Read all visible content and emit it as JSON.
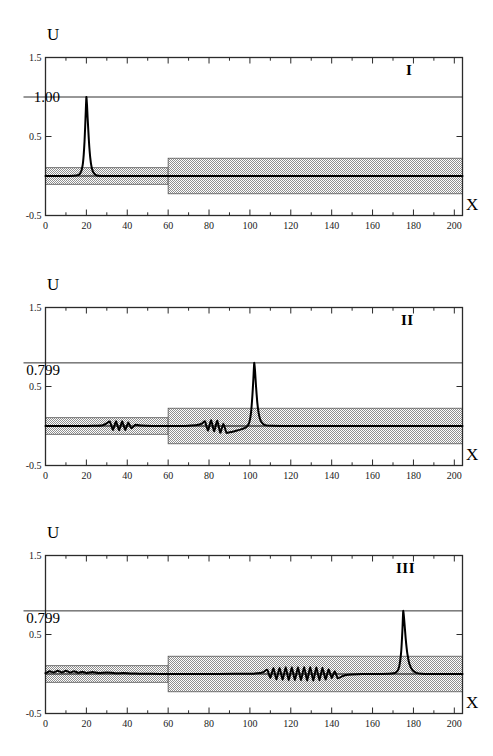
{
  "figure": {
    "width": 493,
    "height": 756,
    "background": "#ffffff",
    "ink": "#000000",
    "band_fill": "#b4b4b4",
    "band_edge": "#4d4d4d"
  },
  "axes": {
    "x_title": "X",
    "y_title": "U",
    "xlim": [
      0,
      204
    ],
    "ylim": [
      -0.5,
      1.5
    ],
    "x_major_ticks": [
      0,
      20,
      40,
      60,
      80,
      100,
      120,
      140,
      160,
      180,
      200
    ],
    "x_tick_labels": [
      "0",
      "20",
      "40",
      "60",
      "80",
      "100",
      "120",
      "140",
      "160",
      "180",
      "200"
    ],
    "y_major_ticks": [
      -0.5,
      0.5,
      1.5
    ],
    "y_tick_labels": [
      "-0.5",
      "0.5",
      "1.5"
    ],
    "grid": false,
    "minor_tick_step": 10
  },
  "panels": [
    {
      "id": "I",
      "label": "I",
      "peak_label": "1.00",
      "peak_value": 1.0,
      "peak_x": 20.0
    },
    {
      "id": "II",
      "label": "II",
      "peak_label": "0.799",
      "peak_value": 0.799,
      "peak_x": 102.0
    },
    {
      "id": "III",
      "label": "III",
      "peak_label": "0.799",
      "peak_value": 0.799,
      "peak_x": 175.0
    }
  ],
  "chart_data": {
    "type": "line",
    "title": "",
    "subtitle": "",
    "xlabel": "X",
    "ylabel": "U",
    "xlim": [
      0,
      204
    ],
    "ylim": [
      -0.5,
      1.5
    ],
    "grid": false,
    "legend_position": "none",
    "n_subplots": 3,
    "subplot_labels": [
      "I",
      "II",
      "III"
    ],
    "annotations": [
      {
        "subplot": "I",
        "text": "1.00",
        "y": 1.0,
        "type": "reference-line-label"
      },
      {
        "subplot": "I",
        "text": "I",
        "x": 175,
        "y": 1.28,
        "type": "panel-label"
      },
      {
        "subplot": "II",
        "text": "0.799",
        "y": 0.799,
        "type": "reference-line-label"
      },
      {
        "subplot": "II",
        "text": "II",
        "x": 175,
        "y": 1.28,
        "type": "panel-label"
      },
      {
        "subplot": "III",
        "text": "0.799",
        "y": 0.799,
        "type": "reference-line-label"
      },
      {
        "subplot": "III",
        "text": "III",
        "x": 175,
        "y": 1.28,
        "type": "panel-label"
      }
    ],
    "shaded_band": {
      "description": "stippled gray potential/waveguide band, steps wider at x=60",
      "segments": [
        {
          "x_start": 0,
          "x_end": 60,
          "y_lower": -0.105,
          "y_upper": 0.105
        },
        {
          "x_start": 60,
          "x_end": 204,
          "y_lower": -0.225,
          "y_upper": 0.225
        }
      ]
    },
    "reference_lines": [
      {
        "subplot": "I",
        "y": 1.0
      },
      {
        "subplot": "II",
        "y": 0.799
      },
      {
        "subplot": "III",
        "y": 0.799
      }
    ],
    "series": [
      {
        "name": "I",
        "subplot": "I",
        "peak_x": 20.0,
        "peak_y": 1.0,
        "baseline": 0.0,
        "x": [
          0,
          4,
          8,
          12,
          15,
          16.5,
          17.5,
          18.2,
          18.7,
          19.1,
          19.4,
          19.7,
          20,
          20.3,
          20.6,
          21,
          21.4,
          21.9,
          22.5,
          23.3,
          24.5,
          26,
          29,
          33,
          40,
          50,
          60,
          70,
          85,
          100,
          120,
          140,
          160,
          180,
          204
        ],
        "y": [
          0,
          0,
          0,
          0,
          0.005,
          0.02,
          0.06,
          0.14,
          0.27,
          0.44,
          0.62,
          0.82,
          1.0,
          0.9,
          0.74,
          0.55,
          0.38,
          0.23,
          0.12,
          0.05,
          0.015,
          0.004,
          0,
          0,
          0,
          0,
          0,
          0,
          0,
          0,
          0,
          0,
          0,
          0,
          0
        ]
      },
      {
        "name": "II",
        "subplot": "II",
        "peak_x": 102.0,
        "peak_y": 0.799,
        "baseline": 0.0,
        "x": [
          0,
          6,
          12,
          18,
          24,
          28,
          30,
          31.5,
          33,
          34.5,
          36,
          37.5,
          39,
          40.5,
          42,
          44,
          47,
          52,
          58,
          62,
          66,
          70,
          74,
          76.5,
          78,
          79.5,
          81,
          82.5,
          84,
          85.5,
          87,
          88.5,
          90,
          92,
          94,
          96,
          98,
          99.5,
          100.5,
          101.2,
          101.7,
          102.1,
          102.5,
          103,
          103.6,
          104.3,
          105.2,
          106.5,
          108,
          111,
          115,
          120,
          130,
          145,
          165,
          185,
          204
        ],
        "y": [
          0,
          0,
          0,
          0,
          0.002,
          0.01,
          0.035,
          0.055,
          -0.05,
          0.06,
          -0.055,
          0.06,
          -0.05,
          0.045,
          -0.03,
          0.015,
          0.005,
          0,
          0,
          0,
          0,
          0.004,
          0.012,
          0.03,
          0.06,
          -0.06,
          0.075,
          -0.07,
          0.07,
          -0.085,
          0.03,
          -0.085,
          -0.08,
          -0.07,
          -0.055,
          -0.04,
          -0.02,
          0.03,
          0.16,
          0.38,
          0.6,
          0.799,
          0.7,
          0.5,
          0.3,
          0.16,
          0.07,
          0.025,
          0.008,
          0.002,
          0,
          0,
          0,
          0,
          0,
          0,
          0
        ]
      },
      {
        "name": "III",
        "subplot": "III",
        "peak_x": 175.0,
        "peak_y": 0.799,
        "baseline": 0.0,
        "x": [
          0,
          2,
          4,
          6,
          8,
          10,
          12,
          14,
          16,
          18,
          20,
          23,
          26,
          30,
          34,
          38,
          42,
          46,
          52,
          60,
          70,
          85,
          100,
          105,
          107,
          108.5,
          110,
          111.5,
          113,
          114.5,
          116,
          117.5,
          119,
          120.5,
          122,
          123.5,
          125,
          126.5,
          128,
          129.5,
          131,
          132.5,
          134,
          135.5,
          137,
          138.5,
          140,
          141.5,
          143,
          145,
          147,
          150,
          155,
          162,
          168,
          171.5,
          173,
          174,
          174.6,
          175,
          175.5,
          176.2,
          177,
          178,
          179.5,
          181.5,
          184,
          188,
          194,
          204
        ],
        "y": [
          0.01,
          0.035,
          0.02,
          0.04,
          0.02,
          0.04,
          0.018,
          0.035,
          0.015,
          0.03,
          0.012,
          0.025,
          0.012,
          0.02,
          0.01,
          0.012,
          0.006,
          0.004,
          0.002,
          0,
          0,
          0,
          0.004,
          0.012,
          0.03,
          0.055,
          -0.05,
          0.075,
          -0.07,
          0.08,
          -0.075,
          0.085,
          -0.08,
          0.085,
          -0.08,
          0.085,
          -0.08,
          0.09,
          -0.085,
          0.09,
          -0.085,
          0.085,
          -0.08,
          0.08,
          -0.07,
          0.06,
          -0.05,
          0.035,
          -0.055,
          -0.03,
          -0.012,
          -0.005,
          0,
          0,
          0.002,
          0.02,
          0.09,
          0.28,
          0.55,
          0.799,
          0.68,
          0.45,
          0.26,
          0.13,
          0.05,
          0.015,
          0.004,
          0,
          0,
          0
        ]
      }
    ]
  }
}
